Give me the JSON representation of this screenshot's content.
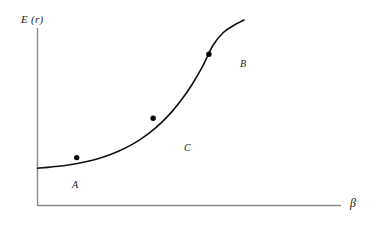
{
  "figure": {
    "background_color": "#ffffff",
    "axis_color": "#8a8a8a",
    "curve_color": "#111111",
    "marker_color": "#000000",
    "y_axis_label": "E (r)",
    "x_axis_label": "β"
  },
  "chart_data": {
    "type": "line",
    "title": "",
    "xlabel": "β",
    "ylabel": "E (r)",
    "grid": false,
    "legend": null,
    "axis_ticks": {
      "x": [],
      "y": []
    },
    "xlim": [
      0,
      1
    ],
    "ylim": [
      0,
      1
    ],
    "series": [
      {
        "name": "E(r) vs beta",
        "description": "Monotonically increasing convex (exponential-like) curve",
        "x": [
          0.0,
          0.05,
          0.1,
          0.15,
          0.2,
          0.25,
          0.3,
          0.35,
          0.4,
          0.45,
          0.5,
          0.55,
          0.6,
          0.65,
          0.7,
          0.75,
          0.8,
          0.85,
          0.9,
          0.95,
          1.0
        ],
        "y": [
          0.05,
          0.055,
          0.062,
          0.071,
          0.082,
          0.096,
          0.114,
          0.136,
          0.163,
          0.196,
          0.236,
          0.284,
          0.342,
          0.411,
          0.493,
          0.59,
          0.704,
          0.838,
          0.92,
          0.965,
          1.0
        ]
      }
    ],
    "annotations": [
      {
        "label": "A",
        "x": 0.19,
        "y": 0.118,
        "label_position": "below"
      },
      {
        "label": "C",
        "x": 0.56,
        "y": 0.37,
        "label_position": "lower-right"
      },
      {
        "label": "B",
        "x": 0.83,
        "y": 0.78,
        "label_position": "right"
      }
    ]
  }
}
